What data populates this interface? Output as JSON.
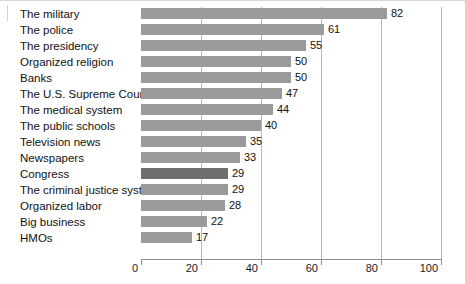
{
  "chart_data": {
    "type": "bar",
    "orientation": "horizontal",
    "title": "",
    "subtitle": "",
    "xlabel": "",
    "ylabel": "",
    "xlim": [
      0,
      100
    ],
    "xticks": [
      0,
      20,
      40,
      60,
      80,
      100
    ],
    "xtick_labels": [
      "0",
      "20",
      "40",
      "60",
      "80",
      "100"
    ],
    "grid": "vertical",
    "legend": "none",
    "bar_color": "#9a9a9a",
    "highlight_color": "#6e6e6e",
    "highlight_category": "Congress",
    "categories": [
      "The military",
      "The police",
      "The presidency",
      "Organized religion",
      "Banks",
      "The U.S. Supreme Court",
      "The medical system",
      "The public schools",
      "Television news",
      "Newspapers",
      "Congress",
      "The criminal justice system",
      "Organized labor",
      "Big business",
      "HMOs"
    ],
    "values": [
      82,
      61,
      55,
      50,
      50,
      47,
      44,
      40,
      35,
      33,
      29,
      29,
      28,
      22,
      17
    ],
    "value_labels": [
      "82",
      "61",
      "55",
      "50",
      "50",
      "47",
      "44",
      "40",
      "35",
      "33",
      "29",
      "29",
      "28",
      "22",
      "17"
    ]
  }
}
